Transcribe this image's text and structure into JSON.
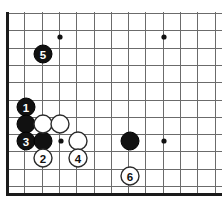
{
  "figure": {
    "board_colors": {
      "background": "#ffffff",
      "grid_line": "#6b6b6b",
      "edge_line": "#1a1a1a",
      "black_stone": "#111111",
      "white_stone": "#ffffff",
      "star_point": "#111111"
    },
    "geometry": {
      "spacing": 17.3,
      "origin_x": 7.5,
      "origin_y": 13.5,
      "stone_radius": 9.0,
      "star_radius": 2.6,
      "cols": 13,
      "rows": 11
    }
  },
  "edges": [
    {
      "name": "left-border",
      "x1": 7.5,
      "y1": 11.5,
      "x2": 7.5,
      "y2": 194.5
    },
    {
      "name": "bottom-border",
      "x1": 6.0,
      "y1": 194.0,
      "x2": 222.0,
      "y2": 194.0
    }
  ],
  "star_points": [
    {
      "name": "star-top-left",
      "x": 60.0,
      "y": 37.0
    },
    {
      "name": "star-top-right",
      "x": 164.0,
      "y": 37.0
    },
    {
      "name": "star-bottom-left",
      "x": 61.0,
      "y": 141.0
    },
    {
      "name": "star-bottom-right",
      "x": 164.0,
      "y": 141.0
    }
  ],
  "stones": [
    {
      "id": "stone-b-1",
      "color": "black",
      "label": "1",
      "x": 26,
      "y": 107
    },
    {
      "id": "stone-b-a",
      "color": "black",
      "label": "",
      "x": 26,
      "y": 124
    },
    {
      "id": "stone-b-3",
      "color": "black",
      "label": "3",
      "x": 26,
      "y": 141
    },
    {
      "id": "stone-b-b",
      "color": "black",
      "label": "",
      "x": 43,
      "y": 141
    },
    {
      "id": "stone-b-5",
      "color": "black",
      "label": "5",
      "x": 43,
      "y": 54
    },
    {
      "id": "stone-b-c",
      "color": "black",
      "label": "",
      "x": 130,
      "y": 141
    },
    {
      "id": "stone-w-a",
      "color": "white",
      "label": "",
      "x": 43,
      "y": 124
    },
    {
      "id": "stone-w-b",
      "color": "white",
      "label": "",
      "x": 60,
      "y": 124
    },
    {
      "id": "stone-w-c",
      "color": "white",
      "label": "",
      "x": 78,
      "y": 141
    },
    {
      "id": "stone-w-2",
      "color": "white",
      "label": "2",
      "x": 43,
      "y": 158
    },
    {
      "id": "stone-w-4",
      "color": "white",
      "label": "4",
      "x": 78,
      "y": 158
    },
    {
      "id": "stone-w-6",
      "color": "white",
      "label": "6",
      "x": 130,
      "y": 176
    }
  ],
  "move_sequence": {
    "moves": [
      {
        "number": "1",
        "color": "black"
      },
      {
        "number": "2",
        "color": "white"
      },
      {
        "number": "3",
        "color": "black"
      },
      {
        "number": "4",
        "color": "white"
      },
      {
        "number": "5",
        "color": "black"
      },
      {
        "number": "6",
        "color": "white"
      }
    ]
  }
}
